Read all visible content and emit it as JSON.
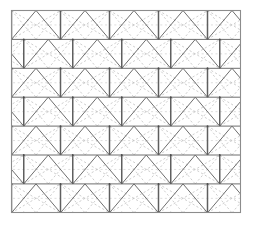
{
  "figure": {
    "type": "geometric-pattern",
    "background_color": "#ffffff",
    "canvas": {
      "width": 253,
      "height": 225
    }
  },
  "frame": {
    "name": "outer-border-rectangle",
    "x": 11.5,
    "y": 10.5,
    "width": 229,
    "height": 202,
    "stroke_color": "#8c8c8c",
    "stroke_width": 1.1,
    "fill": "#ffffff"
  },
  "lattice": {
    "description": "Periodic triangular (isometric) lattice of solid dark strokes with superposed light dashed diagonals",
    "cell_width": 49,
    "cell_height": 28.9,
    "row_count": 8,
    "column_count": 5,
    "origin_x": 11.5,
    "origin_y": 10.5,
    "colors": {
      "solid_stroke": "#6e6e6e",
      "solid_stroke_strong": "#5a5a5a",
      "dashed_stroke": "#c2c2c2",
      "dashed_stroke_faint": "#d4d4d4",
      "vertex_dot": "#4a4a4a",
      "vertical_bar": "#5f5f5f"
    },
    "stroke_widths": {
      "solid": 1.0,
      "vertical_bar": 1.5,
      "dashed": 0.8
    },
    "dash_patterns": {
      "diagonal": "2.2 2.2",
      "horizontal": "2 2.6"
    },
    "vertex_dot_radius": 0.95
  },
  "legend": {
    "items": [
      {
        "label": "solid lattice edge",
        "color": "#6e6e6e",
        "style": "solid"
      },
      {
        "label": "dashed diagonal",
        "color": "#c2c2c2",
        "style": "dashed"
      },
      {
        "label": "lattice vertex",
        "color": "#4a4a4a",
        "style": "dot"
      }
    ]
  }
}
